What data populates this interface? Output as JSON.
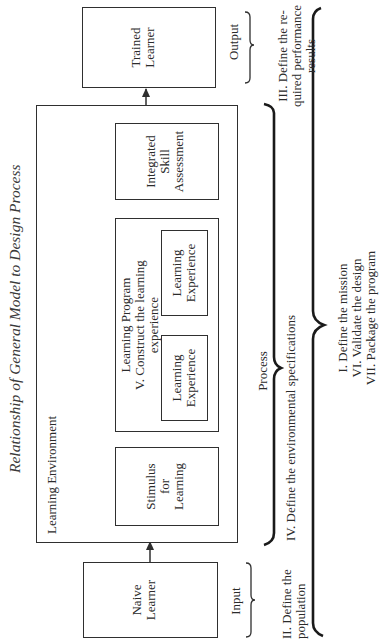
{
  "figure": {
    "title": "Relationship of General Model to Design Process"
  },
  "nodes": {
    "naive_learner": "Naive\nLearner",
    "learning_environment": "Learning Environment",
    "stimulus": "Stimulus\nfor\nLearning",
    "learning_program": "Learning Program\nV. Construct the learning\nexperience",
    "learning_experience_1": "Learning\nExperience",
    "learning_experience_2": "Learning\nExperience",
    "integrated_skill_assessment": "Integrated\nSkill\nAssessment",
    "trained_learner": "Trained\nLearner"
  },
  "stages": {
    "input": "Input",
    "process": "Process",
    "output": "Output"
  },
  "design_steps": {
    "population": "II. Define the\npopulation",
    "environment": "IV. Define the environmental specifications",
    "performance": "III. Define the re-\nquired performance\nresults",
    "overall": "I. Define the mission\nVI. Validate the design\nVII. Package the program"
  },
  "flow": [
    {
      "from": "Naive Learner",
      "to": "Learning Environment"
    },
    {
      "from": "Stimulus for Learning",
      "to": "Learning Program"
    },
    {
      "from": "Learning Experience",
      "to": "Learning Experience"
    },
    {
      "from": "Learning Program",
      "to": "Integrated Skill Assessment"
    },
    {
      "from": "Integrated Skill Assessment",
      "to": "Learning Program",
      "type": "feedback"
    },
    {
      "from": "Learning Environment",
      "to": "Trained Learner"
    }
  ]
}
